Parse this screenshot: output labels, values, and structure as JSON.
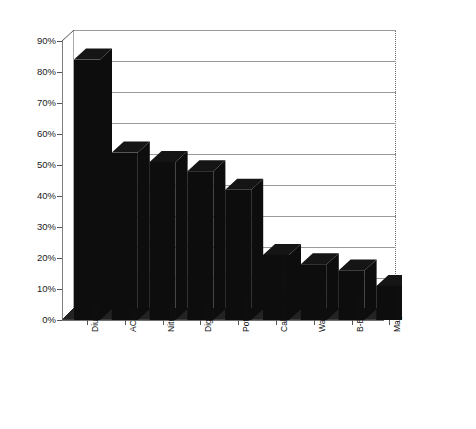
{
  "chart_data": {
    "type": "bar",
    "title": "",
    "subtitle": "",
    "xlabel": "",
    "ylabel": "Percent of Patients",
    "ylim": [
      0,
      90
    ],
    "ytick_labels": [
      "0%",
      "10%",
      "20%",
      "30%",
      "40%",
      "50%",
      "60%",
      "70%",
      "80%",
      "90%"
    ],
    "ytick_values": [
      0,
      10,
      20,
      30,
      40,
      50,
      60,
      70,
      80,
      90
    ],
    "grid": true,
    "legend": "none",
    "style": "3d-bar",
    "bar_color": "#0d0d0d",
    "categories": [
      "Diuretics",
      "ACEIs",
      "Nitrates",
      "Digoxin",
      "Potassium",
      "Calcium Antagonists",
      "Warfarin",
      "B-Blockers",
      "Magnesium"
    ],
    "values": [
      84,
      54,
      51,
      48,
      42,
      21,
      18,
      16,
      11
    ],
    "value_unit": "%"
  },
  "axes": {
    "y_title": "Percent of Patients"
  }
}
